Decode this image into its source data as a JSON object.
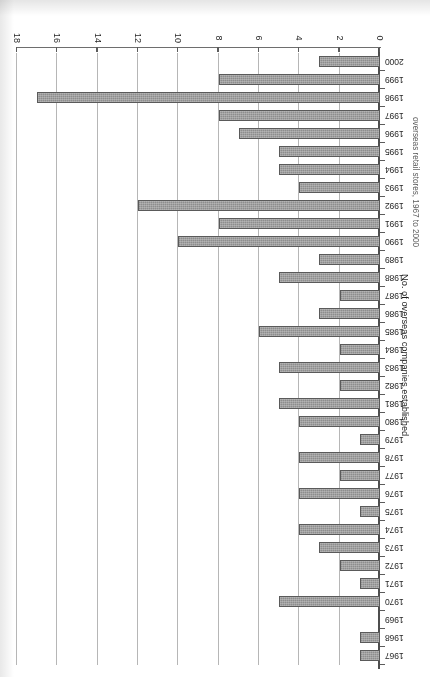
{
  "chart_data": {
    "type": "bar",
    "orientation": "horizontal",
    "title": "",
    "caption": "overseas retail stores, 1967 to 2000",
    "xlabel": "",
    "ylabel": "No. of overseas companies established",
    "value_axis_title": "No. of overseas companies established",
    "categories": [
      "1967",
      "1968",
      "1969",
      "1970",
      "1971",
      "1972",
      "1973",
      "1974",
      "1975",
      "1976",
      "1977",
      "1978",
      "1979",
      "1980",
      "1981",
      "1982",
      "1983",
      "1984",
      "1985",
      "1986",
      "1987",
      "1988",
      "1989",
      "1990",
      "1991",
      "1992",
      "1993",
      "1994",
      "1995",
      "1996",
      "1997",
      "1998",
      "1999",
      "2000"
    ],
    "values": [
      1,
      1,
      0,
      5,
      1,
      2,
      3,
      4,
      1,
      4,
      2,
      4,
      1,
      4,
      5,
      2,
      5,
      2,
      6,
      3,
      2,
      5,
      3,
      10,
      8,
      12,
      4,
      5,
      5,
      7,
      8,
      17,
      8,
      3
    ],
    "ticks": [
      0,
      2,
      4,
      6,
      8,
      10,
      12,
      14,
      16,
      18
    ],
    "tick_labels": [
      "0",
      "2",
      "4",
      "6",
      "8",
      "10",
      "12",
      "14",
      "16",
      "18"
    ],
    "ylim": [
      0,
      18
    ],
    "grid": true,
    "grid_axis": "value",
    "legend": false,
    "legend_position": "none",
    "bar_color": "#8e8e8e",
    "bar_edge_color": "#585858",
    "grid_color": "#b9b9b9",
    "axis_color": "#4b4b4b",
    "rotated_180": true
  }
}
